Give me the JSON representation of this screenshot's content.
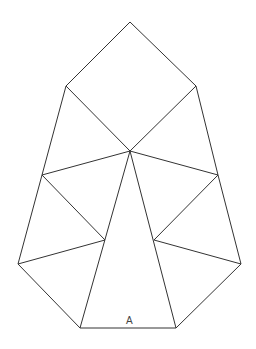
{
  "diagram": {
    "stroke_color": "#333333",
    "label": "A",
    "vertices": {
      "top": [
        130,
        22
      ],
      "sq_left": [
        66,
        86
      ],
      "sq_right": [
        196,
        86
      ],
      "center": [
        130,
        151
      ],
      "mid_left": [
        42,
        175
      ],
      "mid_right": [
        218,
        175
      ],
      "inner_left": [
        105,
        240
      ],
      "inner_right": [
        154,
        240
      ],
      "low_left": [
        18,
        264
      ],
      "low_right": [
        241,
        264
      ],
      "base_left": [
        80,
        328
      ],
      "base_right": [
        176,
        328
      ]
    },
    "edges": [
      [
        "top",
        "sq_left"
      ],
      [
        "top",
        "sq_right"
      ],
      [
        "sq_left",
        "center"
      ],
      [
        "sq_right",
        "center"
      ],
      [
        "sq_left",
        "mid_left"
      ],
      [
        "sq_right",
        "mid_right"
      ],
      [
        "mid_left",
        "center"
      ],
      [
        "mid_right",
        "center"
      ],
      [
        "mid_left",
        "inner_left"
      ],
      [
        "mid_right",
        "inner_right"
      ],
      [
        "mid_left",
        "low_left"
      ],
      [
        "mid_right",
        "low_right"
      ],
      [
        "low_left",
        "inner_left"
      ],
      [
        "low_right",
        "inner_right"
      ],
      [
        "low_left",
        "base_left"
      ],
      [
        "low_right",
        "base_right"
      ],
      [
        "center",
        "base_left"
      ],
      [
        "center",
        "base_right"
      ],
      [
        "base_left",
        "base_right"
      ]
    ]
  }
}
